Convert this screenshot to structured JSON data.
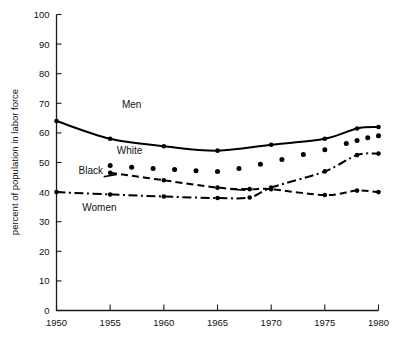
{
  "chart_data": {
    "type": "line",
    "title": "",
    "xlabel": "",
    "ylabel": "percent of population in labor force",
    "xlim": [
      1950,
      1980
    ],
    "ylim": [
      0,
      100
    ],
    "grid": false,
    "legend_position": "inline-annotations",
    "x_ticks": [
      "1950",
      "1955",
      "1960",
      "1965",
      "1970",
      "1975",
      "1980"
    ],
    "y_ticks": [
      "0",
      "10",
      "20",
      "30",
      "40",
      "50",
      "60",
      "70",
      "80",
      "90",
      "100"
    ],
    "series": [
      {
        "name": "Men",
        "line_style": "solid",
        "x": [
          1950,
          1955,
          1960,
          1965,
          1970,
          1975,
          1978,
          1980
        ],
        "values": [
          64,
          58,
          55.5,
          54,
          56,
          58,
          61.5,
          62
        ]
      },
      {
        "name": "White",
        "line_style": "dotted",
        "x": [
          1955,
          1957,
          1959,
          1961,
          1963,
          1965,
          1967,
          1969,
          1971,
          1973,
          1975,
          1977,
          1978,
          1979,
          1980
        ],
        "values": [
          49,
          48.4,
          48,
          47.6,
          47.2,
          47,
          48,
          49.4,
          51,
          52.7,
          54.3,
          56.4,
          57.4,
          58.4,
          59
        ]
      },
      {
        "name": "Black",
        "line_style": "dashed",
        "x": [
          1955,
          1960,
          1965,
          1968,
          1970,
          1975,
          1978,
          1980
        ],
        "values": [
          46.5,
          44,
          41.5,
          41,
          41,
          39,
          40.5,
          40
        ]
      },
      {
        "name": "Women",
        "line_style": "dash-dot",
        "x": [
          1950,
          1955,
          1960,
          1965,
          1968,
          1970,
          1975,
          1978,
          1980
        ],
        "values": [
          40,
          39.2,
          38.5,
          38,
          38.2,
          41.5,
          47,
          52.5,
          53
        ]
      }
    ],
    "annotations": [
      {
        "text": "Men",
        "x": 1957.0,
        "y": 68.5
      },
      {
        "text": "White",
        "x": 1956.8,
        "y": 53.0
      },
      {
        "text": "Black",
        "x": 1953.2,
        "y": 46.2
      },
      {
        "text": "Women",
        "x": 1954.0,
        "y": 33.5
      }
    ]
  },
  "axis": {
    "y_title": "percent of population in labor force"
  }
}
